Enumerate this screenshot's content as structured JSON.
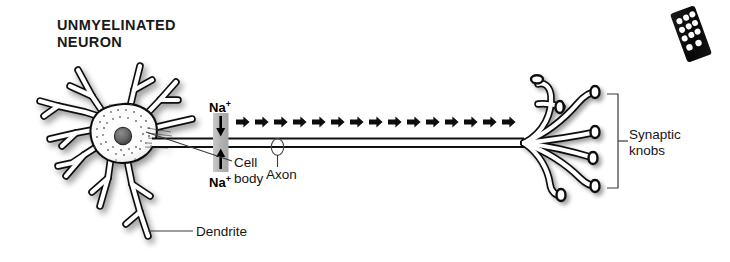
{
  "figure": {
    "title_line1": "UNMYELINATED",
    "title_line2": "NEURON",
    "title": "UNMYELINATED\nNEURON",
    "style": "black-and-white line drawing with grey shading"
  },
  "labels": {
    "cell_body": "Cell\nbody",
    "cell_body_line1": "Cell",
    "cell_body_line2": "body",
    "dendrite": "Dendrite",
    "axon": "Axon",
    "synaptic_knobs": "Synaptic\nknobs",
    "synaptic_knobs_line1": "Synaptic",
    "synaptic_knobs_line2": "knobs"
  },
  "ion_channel": {
    "ion_label": "Na",
    "ion_charge": "+",
    "ion_label_full": "Na+",
    "top_arrow_direction": "down",
    "bottom_arrow_direction": "up",
    "channel_fill": "#b9b9b9"
  },
  "impulse": {
    "direction": "left-to-right",
    "arrow_count": 15,
    "arrow_start_x": 236,
    "arrow_spacing": 19,
    "arrow_color": "#0d0d0d"
  },
  "structure": {
    "soma_nucleus_color": "#6b6b6b",
    "outline_color": "#111111",
    "shadow_color": "#b0b0b0",
    "axon_y_top": 138,
    "axon_y_bottom": 147,
    "terminal_branch_x": 520,
    "knob_count": 6
  },
  "overlay_object": {
    "name": "remote-control",
    "body_color": "#0a0a0a",
    "button_color": "#ffffff",
    "rotation_deg": -20,
    "button_rows": 4
  },
  "colors": {
    "background": "#ffffff",
    "ink": "#111111",
    "grey_fill": "#b9b9b9",
    "text": "#151515"
  }
}
